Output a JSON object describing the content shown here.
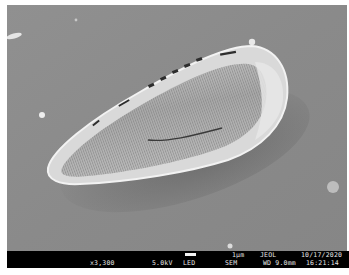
{
  "image": {
    "subject": "diatom-frustule",
    "background_color": "#8d8d8d"
  },
  "info_bar": {
    "magnification": "x3,300",
    "voltage": "5.0kV",
    "detector": "LED",
    "scale_label": "1µm",
    "mode": "SEM",
    "manufacturer": "JEOL",
    "working_distance": "WD 9.0mm",
    "date": "10/17/2020",
    "time": "16:21:14"
  }
}
